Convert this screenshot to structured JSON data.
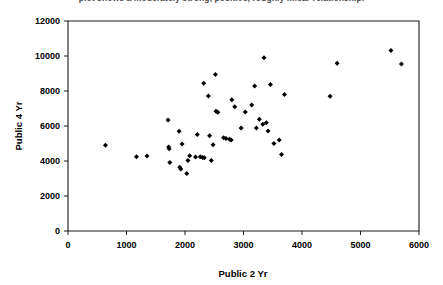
{
  "caption": {
    "text": "plot shows a moderately strong, positive, roughly linear relationship."
  },
  "chart_data": {
    "type": "scatter",
    "title": "",
    "xlabel": "Public 2 Yr",
    "ylabel": "Public 4 Yr",
    "xlim": [
      0,
      6000
    ],
    "ylim": [
      0,
      12000
    ],
    "xticks": [
      0,
      1000,
      2000,
      3000,
      4000,
      5000,
      6000
    ],
    "yticks": [
      0,
      2000,
      4000,
      6000,
      8000,
      10000,
      12000
    ],
    "xticklabels": [
      "0",
      "1000",
      "2000",
      "3000",
      "4000",
      "5000",
      "6000"
    ],
    "yticklabels": [
      "0",
      "2000",
      "4000",
      "6000",
      "8000",
      "10000",
      "12000"
    ],
    "grid": false,
    "legend": null,
    "marker": "diamond",
    "marker_color": "#000000",
    "points": [
      [
        640,
        4900
      ],
      [
        1170,
        4250
      ],
      [
        1350,
        4280
      ],
      [
        1710,
        6350
      ],
      [
        1720,
        4800
      ],
      [
        1730,
        4700
      ],
      [
        1740,
        3920
      ],
      [
        1900,
        5700
      ],
      [
        1910,
        3650
      ],
      [
        1930,
        3550
      ],
      [
        1950,
        4970
      ],
      [
        2030,
        3290
      ],
      [
        2050,
        4030
      ],
      [
        2080,
        4300
      ],
      [
        2180,
        4230
      ],
      [
        2210,
        5510
      ],
      [
        2260,
        4240
      ],
      [
        2300,
        4200
      ],
      [
        2320,
        8450
      ],
      [
        2330,
        4180
      ],
      [
        2400,
        7720
      ],
      [
        2420,
        5450
      ],
      [
        2450,
        4030
      ],
      [
        2480,
        4930
      ],
      [
        2520,
        8950
      ],
      [
        2530,
        6850
      ],
      [
        2560,
        6780
      ],
      [
        2660,
        5330
      ],
      [
        2700,
        5290
      ],
      [
        2760,
        5250
      ],
      [
        2790,
        5200
      ],
      [
        2800,
        7500
      ],
      [
        2850,
        7100
      ],
      [
        2960,
        5880
      ],
      [
        3030,
        6800
      ],
      [
        3140,
        7200
      ],
      [
        3190,
        8280
      ],
      [
        3220,
        5880
      ],
      [
        3270,
        6380
      ],
      [
        3330,
        6100
      ],
      [
        3350,
        9900
      ],
      [
        3390,
        6180
      ],
      [
        3420,
        5720
      ],
      [
        3460,
        8370
      ],
      [
        3520,
        5000
      ],
      [
        3610,
        5200
      ],
      [
        3650,
        4370
      ],
      [
        3700,
        7800
      ],
      [
        4480,
        7700
      ],
      [
        4600,
        9580
      ],
      [
        5520,
        10320
      ],
      [
        5700,
        9550
      ]
    ]
  }
}
